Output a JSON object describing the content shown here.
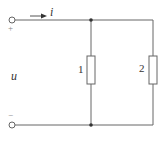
{
  "diagram": {
    "type": "circuit",
    "current_label": "i",
    "voltage_label": "u",
    "plus_sign": "+",
    "minus_sign": "−",
    "resistors": [
      {
        "label": "1"
      },
      {
        "label": "2"
      }
    ],
    "colors": {
      "wire": "#666666",
      "text": "#333333",
      "background": "#ffffff"
    }
  }
}
